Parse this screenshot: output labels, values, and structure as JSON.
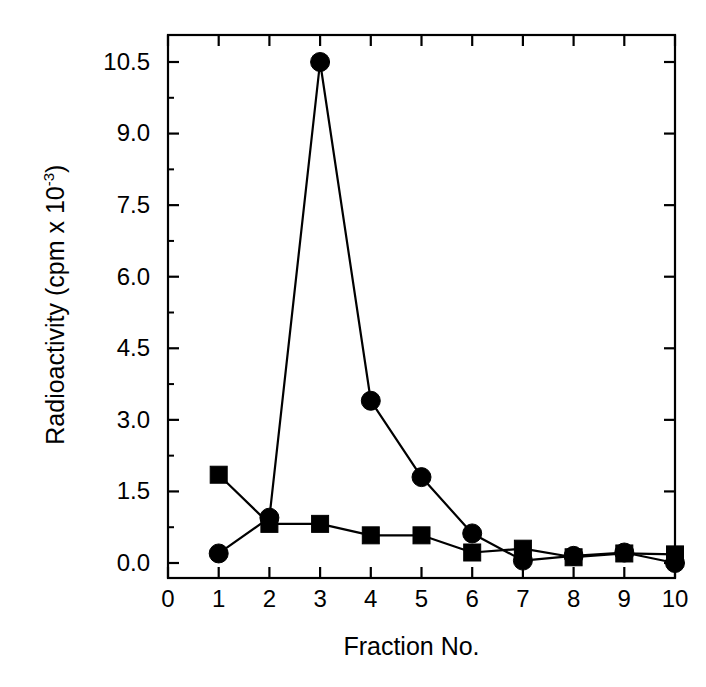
{
  "chart_data": {
    "type": "line",
    "title": "",
    "xlabel": "Fraction No.",
    "ylabel": "Radioactivity (cpm x 10-3)",
    "ylabel_base": "Radioactivity (cpm x 10",
    "ylabel_exponent": "-3",
    "ylabel_tail": ")",
    "x": [
      1,
      2,
      3,
      4,
      5,
      6,
      7,
      8,
      9,
      10
    ],
    "xlim": [
      0,
      10
    ],
    "ylim": [
      0.0,
      11.1
    ],
    "xticks": [
      "0",
      "1",
      "2",
      "3",
      "4",
      "5",
      "6",
      "7",
      "8",
      "9",
      "10"
    ],
    "xtick_values": [
      0,
      1,
      2,
      3,
      4,
      5,
      6,
      7,
      8,
      9,
      10
    ],
    "yticks": [
      "0.0",
      "1.5",
      "3.0",
      "4.5",
      "6.0",
      "7.5",
      "9.0",
      "10.5"
    ],
    "ytick_values": [
      0.0,
      1.5,
      3.0,
      4.5,
      6.0,
      7.5,
      9.0,
      10.5
    ],
    "grid": false,
    "legend": "none",
    "series": [
      {
        "name": "circle-series",
        "marker": "circle",
        "color": "#000000",
        "values": [
          0.2,
          0.95,
          10.5,
          3.4,
          1.8,
          0.62,
          0.05,
          0.15,
          0.22,
          0.0
        ]
      },
      {
        "name": "square-series",
        "marker": "square",
        "color": "#000000",
        "values": [
          1.85,
          0.82,
          0.82,
          0.58,
          0.58,
          0.22,
          0.3,
          0.12,
          0.2,
          0.18
        ]
      }
    ]
  },
  "figure": {
    "background": "#ffffff",
    "axis_color": "#000000",
    "plot_left": 168,
    "plot_right": 675,
    "plot_top": 35,
    "plot_bottom": 578
  }
}
